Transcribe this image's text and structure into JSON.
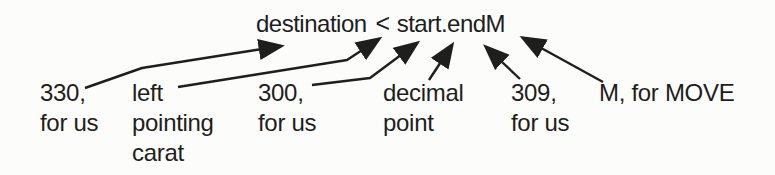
{
  "diagram": {
    "formula": {
      "destination": "destination",
      "carat": "<",
      "start": "start",
      "decimal_point": ".",
      "end": "end",
      "move": "M"
    },
    "labels": {
      "l330": {
        "line1": "330,",
        "line2": "for us"
      },
      "carat": {
        "line1": "left",
        "line2": "pointing",
        "line3": "carat"
      },
      "l300": {
        "line1": "300,",
        "line2": "for us"
      },
      "decimal": {
        "line1": "decimal",
        "line2": "point"
      },
      "l309": {
        "line1": "309,",
        "line2": "for us"
      },
      "move": {
        "line1": "M, for MOVE"
      }
    },
    "arrows": [
      {
        "name": "arrow-330-to-destination",
        "points": "85,88 142,68 281,46"
      },
      {
        "name": "arrow-left-carat-to-carat",
        "points": "178,87 347,60 379,39"
      },
      {
        "name": "arrow-300-to-start",
        "points": "312,85 370,78 417,43"
      },
      {
        "name": "arrow-decimal-to-point",
        "points": "429,80 452,45"
      },
      {
        "name": "arrow-309-to-end",
        "points": "520,79 486,47"
      },
      {
        "name": "arrow-move-to-m",
        "points": "603,82 523,38"
      }
    ],
    "colors": {
      "ink": "#1e1e1c",
      "paper": "#fcfcfa"
    }
  }
}
